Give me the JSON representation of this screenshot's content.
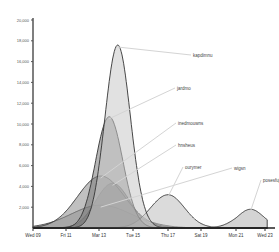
{
  "chart_data": {
    "type": "area",
    "title": "",
    "xlabel": "",
    "ylabel": "",
    "ylim": [
      0,
      20000
    ],
    "grid": false,
    "legend_position": "inline-leader-labels-right",
    "y_ticks": [
      2000,
      4000,
      6000,
      8000,
      10000,
      12000,
      14000,
      16000,
      18000,
      20000
    ],
    "y_tick_labels": [
      "2,000",
      "4,000",
      "6,000",
      "8,000",
      "10,000",
      "12,000",
      "14,000",
      "16,000",
      "18,000",
      "20,000"
    ],
    "x_tick_labels": [
      "Wed 09",
      "Fri 11",
      "Mar 13",
      "Tue 15",
      "Thu 17",
      "Sat 19",
      "Mon 21",
      "Wed 23"
    ],
    "x_days": [
      9,
      11,
      13,
      15,
      17,
      19,
      21,
      23
    ],
    "series": [
      {
        "name": "wigsn",
        "peak_day": 13.1,
        "peak_value": 2200,
        "width_days": 1.8,
        "fill": "#9a9a9a",
        "label_x": 234,
        "label_y": 170
      },
      {
        "name": "hnsheus",
        "peak_day": 13.8,
        "peak_value": 4300,
        "width_days": 1.0,
        "fill": "#555555",
        "label_x": 178,
        "label_y": 147
      },
      {
        "name": "inedmouwns",
        "peak_day": 13.1,
        "peak_value": 5000,
        "width_days": 1.4,
        "fill": "#8c8c8c",
        "label_x": 178,
        "label_y": 125
      },
      {
        "name": "ourymer",
        "peak_day": 17.0,
        "peak_value": 3200,
        "width_days": 1.0,
        "fill": "#bdbdbd",
        "label_x": 185,
        "label_y": 169
      },
      {
        "name": "posesfuju",
        "peak_day": 22.0,
        "peak_value": 1800,
        "width_days": 0.9,
        "fill": "#b0b0b0",
        "label_x": 263,
        "label_y": 182
      },
      {
        "name": "jardmo",
        "peak_day": 13.6,
        "peak_value": 10700,
        "width_days": 0.8,
        "fill": "#7a7a7a",
        "label_x": 177,
        "label_y": 90
      },
      {
        "name": "kapdimnu",
        "peak_day": 14.1,
        "peak_value": 17600,
        "width_days": 0.75,
        "fill": "#c8c8c8",
        "label_x": 193,
        "label_y": 57
      }
    ]
  }
}
